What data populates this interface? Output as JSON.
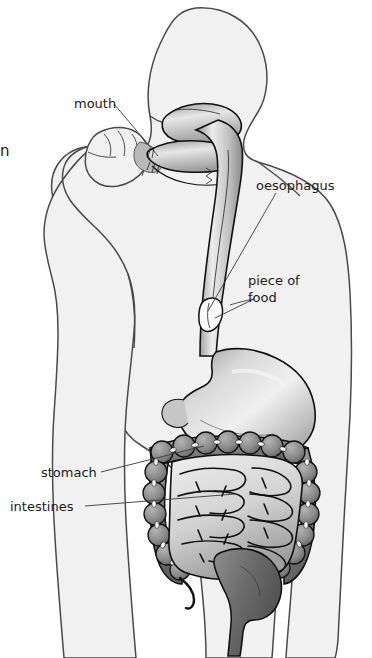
{
  "figure": {
    "background_color": "#ffffff",
    "body_fill": "#f1f1f1",
    "body_outline_color": "#4a4a4a",
    "organ_outline_color": "#111111",
    "label_color": "#1b1b1b"
  },
  "labels": {
    "mouth": "mouth",
    "oesophagus": "oesophagus",
    "piece_of_food_line1": "piece of",
    "piece_of_food_line2": "food",
    "stomach": "stomach",
    "intestines": "intestines"
  },
  "edge_text": {
    "cropped_fragment": "n"
  },
  "organs": [
    {
      "name": "mouth",
      "shade": "#c9c9c9",
      "note": "tongue, palate and teeth in profile"
    },
    {
      "name": "oesophagus",
      "shade": "#bdbdbd",
      "note": "tube from throat to stomach"
    },
    {
      "name": "piece-of-food",
      "shade": "#ffffff",
      "note": "bolus inside oesophagus"
    },
    {
      "name": "stomach",
      "shade": "#c4c4c4",
      "note": "J-shaped sac with highlight"
    },
    {
      "name": "small-intestine",
      "shade": "#d5d5d5",
      "note": "coiled light loops"
    },
    {
      "name": "large-intestine",
      "shade": "#8a8a8a",
      "note": "dark haustrated frame"
    },
    {
      "name": "rectum",
      "shade": "#6f6f6f",
      "note": "central descending end"
    }
  ]
}
